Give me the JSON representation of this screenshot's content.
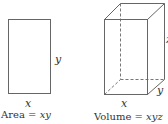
{
  "figure": {
    "rectangle": {
      "width_label": "x",
      "height_label": "y",
      "caption_prefix": "Area = ",
      "caption_expr": "xy"
    },
    "box": {
      "width_label": "x",
      "depth_label": "y",
      "height_label": "z",
      "caption_prefix": "Volume = ",
      "caption_expr": "xyz"
    },
    "colors": {
      "stroke": "#555555",
      "text": "#333333",
      "background": "#ffffff"
    }
  }
}
